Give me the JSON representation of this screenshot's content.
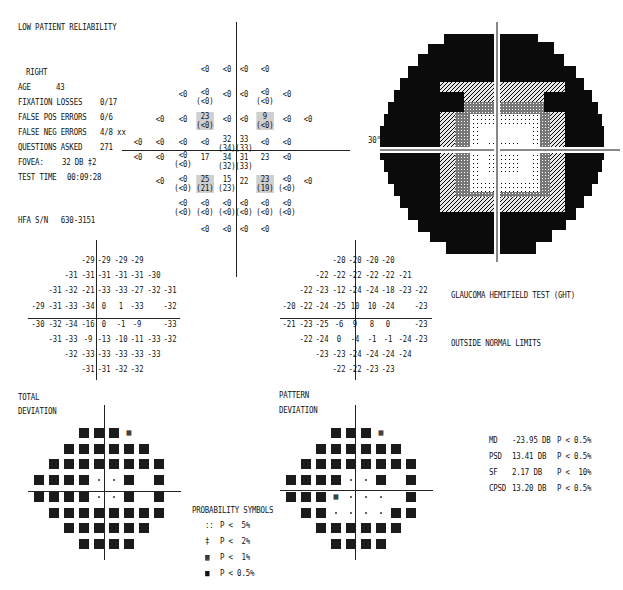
{
  "header": {
    "reliability": "LOW PATIENT RELIABILITY",
    "eye": "RIGHT",
    "rows": [
      {
        "label": "AGE",
        "value": "43"
      },
      {
        "label": "FIXATION LOSSES",
        "value": "0/17"
      },
      {
        "label": "FALSE POS ERRORS",
        "value": "0/6"
      },
      {
        "label": "FALSE NEG ERRORS",
        "value": "4/8 xx"
      },
      {
        "label": "QUESTIONS ASKED",
        "value": "271"
      },
      {
        "label": "FOVEA:",
        "value": "32 DB ‡2"
      },
      {
        "label": "TEST TIME",
        "value": "00:09:28"
      }
    ],
    "serial": "HFA S/N   630-3151"
  },
  "threshold": {
    "cells": [
      {
        "x": 205,
        "y": 70,
        "t": "<0"
      },
      {
        "x": 227,
        "y": 70,
        "t": "<0"
      },
      {
        "x": 244,
        "y": 70,
        "t": "<0"
      },
      {
        "x": 265,
        "y": 70,
        "t": "<0"
      },
      {
        "x": 183,
        "y": 95,
        "t": "<0"
      },
      {
        "x": 205,
        "y": 93,
        "t": "<0\n(<0)"
      },
      {
        "x": 227,
        "y": 95,
        "t": "<0"
      },
      {
        "x": 244,
        "y": 95,
        "t": "<0"
      },
      {
        "x": 265,
        "y": 93,
        "t": "<0\n(<0)"
      },
      {
        "x": 287,
        "y": 95,
        "t": "<0"
      },
      {
        "x": 160,
        "y": 120,
        "t": "<0"
      },
      {
        "x": 183,
        "y": 120,
        "t": "<0"
      },
      {
        "x": 205,
        "y": 117,
        "t": "23\n(<0)",
        "hl": true
      },
      {
        "x": 227,
        "y": 120,
        "t": "<0"
      },
      {
        "x": 244,
        "y": 120,
        "t": "<0"
      },
      {
        "x": 265,
        "y": 117,
        "t": "9\n(<0)",
        "hl": true
      },
      {
        "x": 287,
        "y": 120,
        "t": "<0"
      },
      {
        "x": 308,
        "y": 120,
        "t": "<0"
      },
      {
        "x": 138,
        "y": 143,
        "t": "<0"
      },
      {
        "x": 160,
        "y": 143,
        "t": "<0"
      },
      {
        "x": 183,
        "y": 143,
        "t": "<0"
      },
      {
        "x": 205,
        "y": 143,
        "t": "<0"
      },
      {
        "x": 227,
        "y": 140,
        "t": "32\n(34)"
      },
      {
        "x": 244,
        "y": 140,
        "t": "33\n(33)"
      },
      {
        "x": 265,
        "y": 143,
        "t": "<0"
      },
      {
        "x": 287,
        "y": 143,
        "t": "<0"
      },
      {
        "x": 138,
        "y": 158,
        "t": "<0"
      },
      {
        "x": 160,
        "y": 158,
        "t": "<0"
      },
      {
        "x": 183,
        "y": 156,
        "t": "<0\n(<0)"
      },
      {
        "x": 205,
        "y": 158,
        "t": "17"
      },
      {
        "x": 227,
        "y": 158,
        "t": "34\n(32)"
      },
      {
        "x": 244,
        "y": 158,
        "t": "31\n(33)"
      },
      {
        "x": 265,
        "y": 158,
        "t": "23"
      },
      {
        "x": 287,
        "y": 158,
        "t": "<0"
      },
      {
        "x": 160,
        "y": 182,
        "t": "<0"
      },
      {
        "x": 183,
        "y": 180,
        "t": "<0\n(<0)"
      },
      {
        "x": 205,
        "y": 180,
        "t": "25\n(21)",
        "hl": true
      },
      {
        "x": 227,
        "y": 180,
        "t": "15\n(23)"
      },
      {
        "x": 244,
        "y": 182,
        "t": "22"
      },
      {
        "x": 265,
        "y": 180,
        "t": "23\n(19)",
        "hl": true
      },
      {
        "x": 287,
        "y": 180,
        "t": "<0\n(<0)"
      },
      {
        "x": 308,
        "y": 182,
        "t": "<0"
      },
      {
        "x": 183,
        "y": 204,
        "t": "<0\n(<0)"
      },
      {
        "x": 205,
        "y": 204,
        "t": "<0\n(<0)"
      },
      {
        "x": 227,
        "y": 204,
        "t": "<0\n(<0)"
      },
      {
        "x": 244,
        "y": 204,
        "t": "<0\n(<0)"
      },
      {
        "x": 265,
        "y": 204,
        "t": "<0\n(<0)"
      },
      {
        "x": 287,
        "y": 204,
        "t": "<0\n(<0)"
      },
      {
        "x": 205,
        "y": 230,
        "t": "<0"
      },
      {
        "x": 227,
        "y": 230,
        "t": "<0"
      },
      {
        "x": 244,
        "y": 230,
        "t": "<0"
      },
      {
        "x": 265,
        "y": 230,
        "t": "<0"
      }
    ]
  },
  "greyscale": {
    "label_30": "30°"
  },
  "total_deviation": {
    "rows": [
      [
        "",
        "",
        "",
        "-29",
        "-29",
        "-29",
        "-29",
        "",
        "",
        ""
      ],
      [
        "",
        "",
        "-31",
        "-31",
        "-31",
        "-31",
        "-31",
        "-30",
        "",
        ""
      ],
      [
        "",
        "-31",
        "-32",
        "-21",
        "-33",
        "-33",
        "-27",
        "-32",
        "-31",
        ""
      ],
      [
        "-29",
        "-31",
        "-33",
        "-34",
        "0",
        "1",
        "-33",
        "",
        "-32",
        ""
      ],
      [
        "-30",
        "-32",
        "-34",
        "-16",
        "0",
        "-1",
        "-9",
        "",
        "-33",
        ""
      ],
      [
        "",
        "-31",
        "-33",
        "-9",
        "-13",
        "-10",
        "-11",
        "-33",
        "-32",
        ""
      ],
      [
        "",
        "",
        "-32",
        "-33",
        "-33",
        "-33",
        "-33",
        "-33",
        "",
        ""
      ],
      [
        "",
        "",
        "",
        "-31",
        "-31",
        "-32",
        "-32",
        "",
        "",
        ""
      ]
    ],
    "title_1": "TOTAL",
    "title_2": "DEVIATION"
  },
  "pattern_deviation": {
    "rows": [
      [
        "",
        "",
        "",
        "-20",
        "-20",
        "-20",
        "-20",
        "",
        "",
        ""
      ],
      [
        "",
        "",
        "-22",
        "-22",
        "-22",
        "-22",
        "-22",
        "-21",
        "",
        ""
      ],
      [
        "",
        "-22",
        "-23",
        "-12",
        "-24",
        "-24",
        "-18",
        "-23",
        "-22",
        ""
      ],
      [
        "-20",
        "-22",
        "-24",
        "-25",
        "10",
        "10",
        "-24",
        "",
        "-23",
        ""
      ],
      [
        "-21",
        "-23",
        "-25",
        "-6",
        "9",
        "8",
        "0",
        "",
        "-23",
        ""
      ],
      [
        "",
        "-22",
        "-24",
        "0",
        "-4",
        "-1",
        "-1",
        "-24",
        "-23",
        ""
      ],
      [
        "",
        "",
        "-23",
        "-23",
        "-24",
        "-24",
        "-24",
        "-24",
        "",
        ""
      ],
      [
        "",
        "",
        "",
        "-22",
        "-22",
        "-23",
        "-23",
        "",
        "",
        ""
      ]
    ],
    "title_1": "PATTERN",
    "title_2": "DEVIATION"
  },
  "total_prob_map": [
    [
      "",
      "",
      "",
      "S",
      "S",
      "S",
      "1",
      "",
      "",
      ""
    ],
    [
      "",
      "",
      "S",
      "S",
      "S",
      "S",
      "S",
      "S",
      "",
      ""
    ],
    [
      "",
      "S",
      "S",
      "S",
      "S",
      "S",
      "S",
      "S",
      "S",
      ""
    ],
    [
      "S",
      "S",
      "S",
      "S",
      ".",
      ".",
      "S",
      "",
      "S",
      ""
    ],
    [
      "S",
      "S",
      "S",
      "S",
      ".",
      ".",
      "S",
      "",
      "S",
      ""
    ],
    [
      "",
      "S",
      "S",
      "S",
      "S",
      "S",
      "S",
      "S",
      "S",
      ""
    ],
    [
      "",
      "",
      "S",
      "S",
      "S",
      "S",
      "S",
      "S",
      "",
      ""
    ],
    [
      "",
      "",
      "",
      "S",
      "S",
      "S",
      "S",
      "",
      "",
      ""
    ]
  ],
  "pattern_prob_map": [
    [
      "",
      "",
      "",
      "S",
      "S",
      "S",
      "1",
      "",
      "",
      ""
    ],
    [
      "",
      "",
      "S",
      "S",
      "S",
      "S",
      "S",
      "S",
      "",
      ""
    ],
    [
      "",
      "S",
      "S",
      "S",
      "S",
      "S",
      "S",
      "S",
      "S",
      ""
    ],
    [
      "S",
      "S",
      "S",
      "S",
      ".",
      ".",
      "S",
      "",
      "S",
      ""
    ],
    [
      "S",
      "S",
      "S",
      "1",
      ".",
      ".",
      ".",
      "",
      "S",
      ""
    ],
    [
      "",
      "S",
      "S",
      ".",
      ".",
      ".",
      ".",
      "S",
      "S",
      ""
    ],
    [
      "",
      "",
      "S",
      "S",
      "S",
      "S",
      "S",
      "S",
      "",
      ""
    ],
    [
      "",
      "",
      "",
      "S",
      "S",
      "S",
      "S",
      "",
      "",
      ""
    ]
  ],
  "ght": {
    "title": "GLAUCOMA HEMIFIELD TEST (GHT)",
    "result": "OUTSIDE NORMAL LIMITS"
  },
  "global_indices": [
    {
      "name": "MD",
      "value": "-23.95 DB",
      "p": "P < 0.5%"
    },
    {
      "name": "PSD",
      "value": "13.41 DB",
      "p": "P < 0.5%"
    },
    {
      "name": "SF",
      "value": "2.17 DB",
      "p": "P <  10%"
    },
    {
      "name": "CPSD",
      "value": "13.20 DB",
      "p": "P < 0.5%"
    }
  ],
  "legend": {
    "title": "PROBABILITY SYMBOLS",
    "items": [
      {
        "sym": "::",
        "label": "P <  5%"
      },
      {
        "sym": "‡",
        "label": "P <  2%"
      },
      {
        "sym": "▩",
        "label": "P <  1%"
      },
      {
        "sym": "■",
        "label": "P < 0.5%"
      }
    ]
  }
}
